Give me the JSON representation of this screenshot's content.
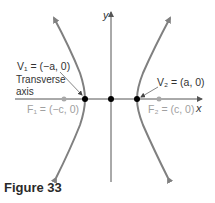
{
  "figure": {
    "caption": "Figure 33",
    "axes": {
      "x_label": "x",
      "y_label": "y"
    },
    "labels": {
      "v1": "V₁ = (−a, 0)",
      "v2": "V₂ = (a, 0)",
      "f1": "F₁ = (−c, 0)",
      "f2": "F₂ = (c, 0)",
      "transverse_line1": "Transverse",
      "transverse_line2": "axis"
    },
    "points": [
      {
        "name": "V1",
        "coords": "(-a, 0)",
        "kind": "vertex"
      },
      {
        "name": "center",
        "coords": "(0, 0)",
        "kind": "center"
      },
      {
        "name": "V2",
        "coords": "(a, 0)",
        "kind": "vertex"
      },
      {
        "name": "F1",
        "coords": "(-c, 0)",
        "kind": "focus"
      },
      {
        "name": "F2",
        "coords": "(c, 0)",
        "kind": "focus"
      }
    ],
    "colors": {
      "curve": "#808080",
      "axis": "#555555",
      "vertex": "#000000",
      "focus": "#a8a8a8",
      "text": "#333333",
      "focus_text": "#a0a0a0"
    }
  }
}
